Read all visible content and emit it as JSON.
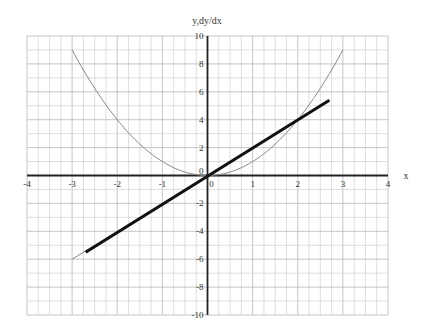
{
  "chart_data": {
    "type": "line",
    "title": "",
    "xlabel": "x",
    "ylabel": "y,dy/dx",
    "xlim": [
      -4,
      4
    ],
    "ylim": [
      -10,
      10
    ],
    "grid": true,
    "legend": null,
    "x_ticks": [
      "-4",
      "-3",
      "-2",
      "-1",
      "0",
      "1",
      "2",
      "3",
      "4"
    ],
    "y_ticks": [
      "10",
      "8",
      "6",
      "4",
      "2",
      "0",
      "-2",
      "-4",
      "-6",
      "-8",
      "-10"
    ],
    "series": [
      {
        "name": "y = x^2",
        "style": "thin gray curve",
        "x": [
          -3,
          -2.5,
          -2,
          -1.5,
          -1,
          -0.5,
          0,
          0.5,
          1,
          1.5,
          2,
          2.5,
          3
        ],
        "y": [
          9,
          6.25,
          4,
          2.25,
          1,
          0.25,
          0,
          0.25,
          1,
          2.25,
          4,
          6.25,
          9
        ]
      },
      {
        "name": "dy/dx = 2x",
        "style": "thin gray line",
        "x": [
          -3,
          2.7
        ],
        "y": [
          -6,
          5.4
        ]
      },
      {
        "name": "tangent/derivative estimate",
        "style": "thick black line",
        "x": [
          -2.7,
          2.7
        ],
        "y": [
          -5.5,
          5.4
        ]
      }
    ]
  },
  "colors": {
    "axis": "#222222",
    "grid_minor": "#d6d6d6",
    "grid_major": "#b8b8b8",
    "curve": "#888888",
    "thick_line": "#111111"
  }
}
